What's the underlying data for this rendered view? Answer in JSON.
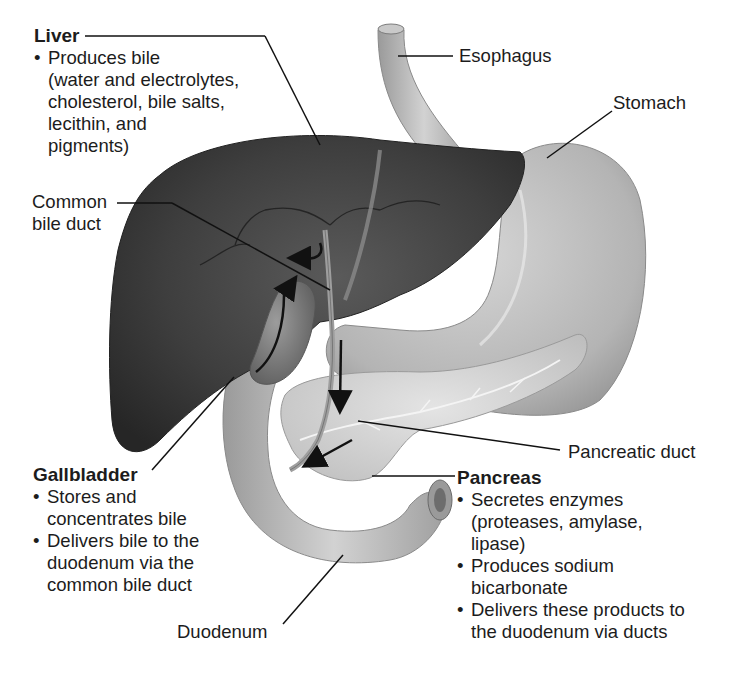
{
  "figure": {
    "colors": {
      "background": "#ffffff",
      "liver": "#3a3a3a",
      "organ_light": "#b8b8b8",
      "label_text": "#1c1c1c",
      "leader_line": "#111111"
    }
  },
  "labels": {
    "liver": {
      "title": "Liver",
      "bullets": [
        {
          "lines": [
            "Produces bile",
            "(water and electrolytes,",
            "cholesterol, bile salts,",
            "lecithin, and",
            "pigments)"
          ]
        }
      ]
    },
    "common_bile_duct": {
      "lines": [
        "Common",
        "bile duct"
      ]
    },
    "esophagus": {
      "text": "Esophagus"
    },
    "stomach": {
      "text": "Stomach"
    },
    "pancreatic_duct": {
      "text": "Pancreatic duct"
    },
    "gallbladder": {
      "title": "Gallbladder",
      "bullets": [
        {
          "lines": [
            "Stores and",
            "concentrates bile"
          ]
        },
        {
          "lines": [
            "Delivers bile to the",
            "duodenum via the",
            "common bile duct"
          ]
        }
      ]
    },
    "pancreas": {
      "title": "Pancreas",
      "bullets": [
        {
          "lines": [
            "Secretes enzymes",
            "(proteases, amylase,",
            "lipase)"
          ]
        },
        {
          "lines": [
            "Produces sodium",
            "bicarbonate"
          ]
        },
        {
          "lines": [
            "Delivers these products to",
            "the duodenum via ducts"
          ]
        }
      ]
    },
    "duodenum": {
      "text": "Duodenum"
    }
  }
}
